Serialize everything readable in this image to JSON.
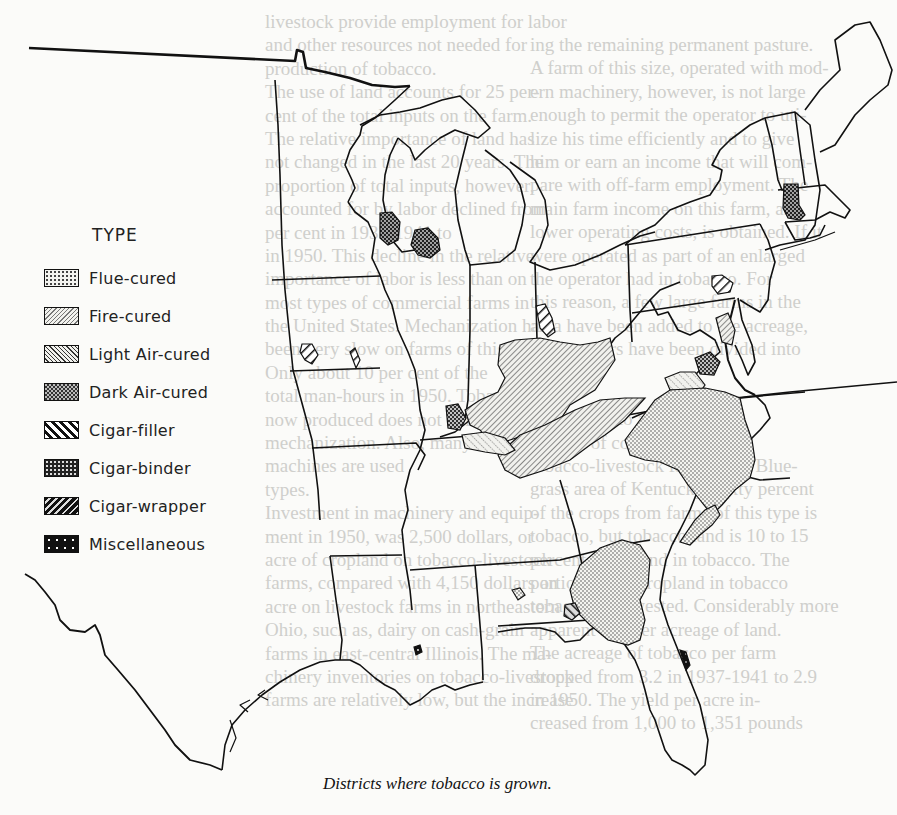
{
  "page": {
    "type": "scanned-book-page",
    "bleed_through_text": {
      "left_column": [
        "livestock provide employment for labor",
        "and other resources not needed for",
        "production of tobacco.",
        "The use of land accounts for 25 per-",
        "cent of the total inputs on the farm.",
        "The relative importance of land has",
        "not changed in the last 20 years. The",
        "proportion of total inputs, however,",
        "accounted for by labor declined from",
        "per cent in 1937-1941 to",
        "in 1950. This decline in the relative",
        "importance of labor is less than on",
        "most types of commercial farms in",
        "the United States. Mechanization has",
        "been very slow on farms of this type.",
        "Only about 10 per cent of the",
        "total man-hours in 1950. Tobacco is",
        "now produced does not lend itself to",
        "mechanization. Also, many of",
        "machines are used",
        "types.",
        "Investment in machinery and equip-",
        "ment in 1950, was 2,500 dollars, or",
        "acre of cropland on tobacco-livestock",
        "farms, compared with 4,150 dollars an",
        "acre on livestock farms in northeastern",
        "Ohio, such as, dairy on cash-grain",
        "farms in east-central Illinois. The ma-",
        "chinery inventories on tobacco-livestock",
        "farms are relatively low, but the increase"
      ],
      "right_column": [
        "ing the remaining permanent pasture.",
        "A farm of this size, operated with mod-",
        "ern machinery, however, is not large",
        "enough to permit the operator to uti-",
        "lize his time efficiently and to give",
        "him or earn an income that will com-",
        "pare with off-farm employment. The",
        "main farm income on this farm, as",
        "lower operating costs, is obtained. If it",
        "were operated as part of an enlarged",
        "the operator had in tobacco. For",
        "this reason, a few large farms in the",
        "area have been added to the acreage,",
        "while others have been divided into",
        "the farm.",
        "",
        "In addition to all",
        "percent of commercial farms",
        "tobacco-livestock farms. The Blue-",
        "grass area of Kentucky. Sixty percent",
        "of the crops from farms of this type is",
        "tobacco, but tobacco land is 10 to 15",
        "percent of all land in tobacco. The",
        "portion of the cropland in tobacco",
        "tobacco is harvested. Considerably more",
        "apparent smaller acreage of land.",
        "The acreage of tobacco per farm",
        "dropped from 3.2 in 1937-1941 to 2.9",
        "in 1950. The yield per acre in-",
        "creased from 1,000 to 1,351 pounds"
      ]
    }
  },
  "map": {
    "title": "Districts where tobacco is grown.",
    "region": "Eastern United States",
    "legend": {
      "title": "TYPE",
      "items": [
        {
          "id": "flue",
          "label": "Flue-cured",
          "pattern": "fine-dots"
        },
        {
          "id": "fire",
          "label": "Fire-cured",
          "pattern": "light-back-hatch"
        },
        {
          "id": "lightair",
          "label": "Light Air-cured",
          "pattern": "fine-diagonal-hatch"
        },
        {
          "id": "darkair",
          "label": "Dark Air-cured",
          "pattern": "crosshatch-dots"
        },
        {
          "id": "filler",
          "label": "Cigar-filler",
          "pattern": "bold-diagonal-hatch"
        },
        {
          "id": "binder",
          "label": "Cigar-binder",
          "pattern": "dense-checker"
        },
        {
          "id": "wrapper",
          "label": "Cigar-wrapper",
          "pattern": "bold-back-hatch"
        },
        {
          "id": "misc",
          "label": "Miscellaneous",
          "pattern": "solid-black-with-dots"
        }
      ]
    },
    "districts": [
      {
        "name": "Wisconsin northern",
        "type": "binder"
      },
      {
        "name": "Wisconsin southern",
        "type": "binder"
      },
      {
        "name": "Connecticut Valley",
        "type": "binder"
      },
      {
        "name": "Pennsylvania Lancaster",
        "type": "filler"
      },
      {
        "name": "Ohio Miami Valley",
        "type": "filler"
      },
      {
        "name": "Minnesota small",
        "type": "filler"
      },
      {
        "name": "Kentucky Burley",
        "type": "lightair"
      },
      {
        "name": "Southern Maryland",
        "type": "lightair"
      },
      {
        "name": "Western Kentucky/Tennessee",
        "type": "fire"
      },
      {
        "name": "Central Virginia",
        "type": "fire"
      },
      {
        "name": "Virginia One-Sucker",
        "type": "darkair"
      },
      {
        "name": "Green River",
        "type": "darkair"
      },
      {
        "name": "Virginia/North Carolina Old Belt",
        "type": "flue"
      },
      {
        "name": "South Carolina Pee Dee",
        "type": "flue"
      },
      {
        "name": "Georgia/Florida Belt",
        "type": "flue"
      },
      {
        "name": "Florida/Georgia Shade",
        "type": "wrapper"
      },
      {
        "name": "Florida east coast",
        "type": "misc"
      },
      {
        "name": "Louisiana Perique",
        "type": "misc"
      }
    ]
  }
}
